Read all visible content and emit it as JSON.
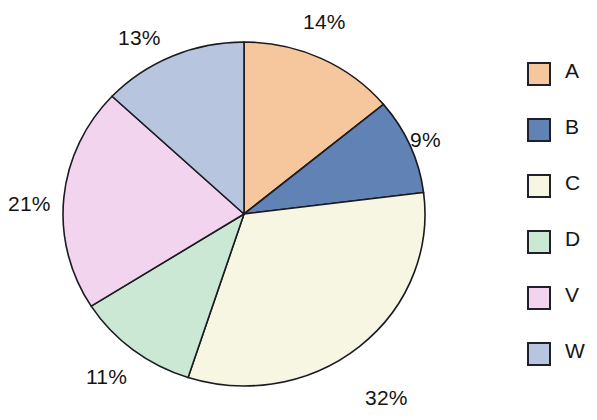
{
  "chart_data": {
    "type": "pie",
    "title": "",
    "subtitle": "",
    "xlabel": "",
    "ylabel": "",
    "grid": false,
    "legend_position": "right",
    "start_angle_deg": 0,
    "direction": "clockwise",
    "units": "percent",
    "categories": [
      "A",
      "B",
      "C",
      "D",
      "V",
      "W"
    ],
    "values": [
      14,
      9,
      32,
      11,
      21,
      13
    ],
    "data_labels": [
      "14%",
      "9%",
      "32%",
      "11%",
      "21%",
      "13%"
    ],
    "colors": [
      "#f6c79c",
      "#6182b4",
      "#f6f6e3",
      "#cbe8d5",
      "#f3d4ee",
      "#b7c6de"
    ],
    "slices": [
      {
        "name": "A",
        "value": 14,
        "label": "14%",
        "color": "#f6c79c"
      },
      {
        "name": "B",
        "value": 9,
        "label": "9%",
        "color": "#6182b4"
      },
      {
        "name": "C",
        "value": 32,
        "label": "32%",
        "color": "#f6f6e3"
      },
      {
        "name": "D",
        "value": 11,
        "label": "11%",
        "color": "#cbe8d5"
      },
      {
        "name": "V",
        "value": 21,
        "label": "21%",
        "color": "#f3d4ee"
      },
      {
        "name": "W",
        "value": 13,
        "label": "13%",
        "color": "#b7c6de"
      }
    ]
  },
  "pie": {
    "center_x": 244,
    "center_y": 214,
    "radius_x": 181,
    "radius_y": 172,
    "outline_color": "#1b1b22",
    "label_positions": [
      {
        "label": "14%",
        "x": 303,
        "y": 10
      },
      {
        "label": "9%",
        "x": 410,
        "y": 128
      },
      {
        "label": "32%",
        "x": 365,
        "y": 386
      },
      {
        "label": "11%",
        "x": 86,
        "y": 365
      },
      {
        "label": "21%",
        "x": 8,
        "y": 192
      },
      {
        "label": "13%",
        "x": 118,
        "y": 26
      }
    ]
  },
  "legend": {
    "items": [
      {
        "label": "A",
        "color": "#f6c79c"
      },
      {
        "label": "B",
        "color": "#6182b4"
      },
      {
        "label": "C",
        "color": "#f6f6e3"
      },
      {
        "label": "D",
        "color": "#cbe8d5"
      },
      {
        "label": "V",
        "color": "#f3d4ee"
      },
      {
        "label": "W",
        "color": "#b7c6de"
      }
    ]
  }
}
